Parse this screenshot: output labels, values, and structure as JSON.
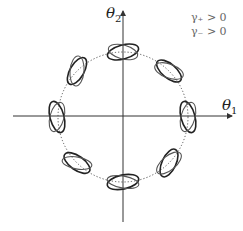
{
  "axes": {
    "x_label": "θ",
    "x_sub": "1",
    "y_label": "θ",
    "y_sub": "2"
  },
  "legend": [
    {
      "text": "γ₊ > 0"
    },
    {
      "text": "γ₋ > 0"
    }
  ],
  "figure": {
    "center": [
      123,
      117
    ],
    "radius": 65,
    "n_orbits": 8,
    "colors": {
      "axis": "#333333",
      "ellipse_dark": "#222222",
      "ellipse_light": "#555555",
      "circle": "#555555"
    }
  }
}
